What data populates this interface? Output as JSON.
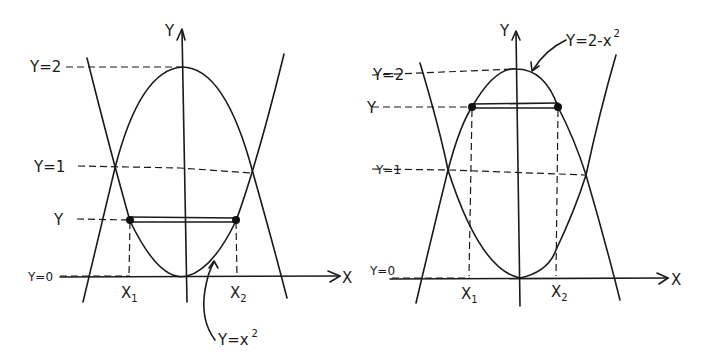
{
  "diagram": {
    "type": "hand-drawn math sketch",
    "panels": [
      {
        "id": "left",
        "axis_labels": {
          "x": "X",
          "y": "Y"
        },
        "level_labels": {
          "y2": "Y=2",
          "y1": "Y=1",
          "yvar": "Y",
          "y0": "Y=0"
        },
        "point_labels": {
          "x1": "X",
          "x1_sub": "1",
          "x2": "X",
          "x2_sub": "2"
        },
        "curve_label": {
          "text": "Y=x",
          "sup": "2"
        },
        "highlighted_curve": "Y=x^2",
        "horizontal_segment_at": "Y (between 0 and 1)"
      },
      {
        "id": "right",
        "axis_labels": {
          "x": "X",
          "y": "Y"
        },
        "level_labels": {
          "y2": "Y=2",
          "y1": "Y=1",
          "yvar": "Y",
          "y0": "Y=0"
        },
        "point_labels": {
          "x1": "X",
          "x1_sub": "1",
          "x2": "X",
          "x2_sub": "2"
        },
        "curve_label": {
          "text": "Y=2-x",
          "sup": "2"
        },
        "highlighted_curve": "Y=2-x^2",
        "horizontal_segment_at": "Y (between 1 and 2)"
      }
    ],
    "curves": [
      "Y=x^2",
      "Y=2-x^2"
    ],
    "intersections_at": "Y=1"
  }
}
